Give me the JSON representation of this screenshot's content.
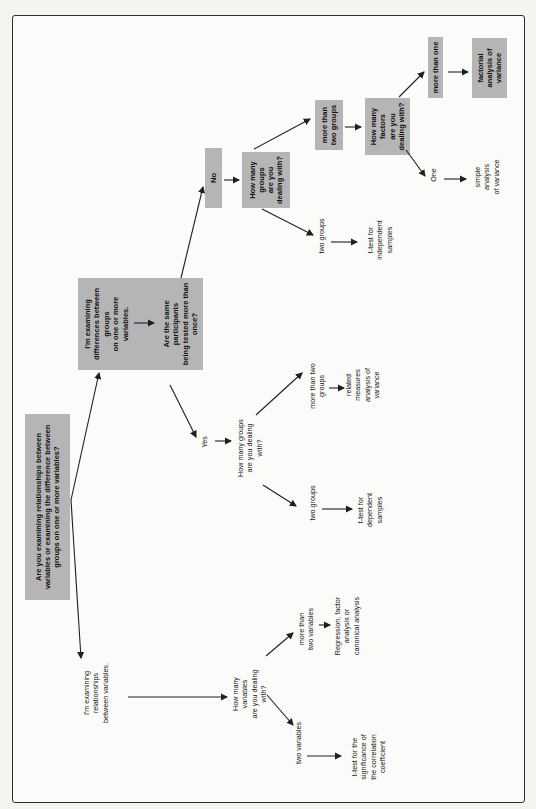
{
  "figure": {
    "kind": "statistics decision-tree flowchart",
    "orientation": "rotated 90 degrees (text reads bottom-to-top)",
    "colors": {
      "shaded_box_fill": "#b5b5b5",
      "line": "#1f1f1f",
      "text": "#141414",
      "frame_border": "#2d2d2d",
      "page_bg": "#f5f4f1"
    }
  },
  "nodes": {
    "root": {
      "label": "Are you examining relationships between\nvariables or examining the difference between\ngroups on one or more variables?",
      "shaded": true
    },
    "rel": {
      "label": "I'm examining\nrelationships\nbetween variables.",
      "shaded": false
    },
    "how_many_vars": {
      "label": "How many\nvariables\nare you dealing\nwith?",
      "shaded": false
    },
    "more_two_vars": {
      "label": "more than\ntwo variables",
      "shaded": false
    },
    "regression": {
      "label": "Regression, factor\nanalysis or\ncanonical analysis",
      "shaded": false
    },
    "two_vars": {
      "label": "two variables",
      "shaded": false
    },
    "ttest_corr": {
      "label": "t-test for the\nsignificance of\nthe correlation\ncoefficient",
      "shaded": false
    },
    "diff": {
      "label": "I'm examining\ndifferences between\ngroups\non one or more\nvariables.",
      "shaded": true
    },
    "same_participants": {
      "label": "Are the same\nparticipants\nbeing tested more than\nonce?",
      "shaded": true
    },
    "yes": {
      "label": "Yes",
      "shaded": false
    },
    "no": {
      "label": "No",
      "shaded": true
    },
    "how_many_groups_yes": {
      "label": "How many groups\nare you dealing\nwith?",
      "shaded": false
    },
    "more_two_groups_yes": {
      "label": "more than two\ngroups",
      "shaded": false
    },
    "related_measures": {
      "label": "related\nmeasures\nanalysis of\nvariance",
      "shaded": false
    },
    "two_groups_yes": {
      "label": "two groups",
      "shaded": false
    },
    "ttest_dep": {
      "label": "t-test for\ndependent\nsamples",
      "shaded": false
    },
    "how_many_groups_no": {
      "label": "How many\ngroups\nare you\ndealing with?",
      "shaded": true
    },
    "more_two_groups_no": {
      "label": "more than\ntwo groups",
      "shaded": true
    },
    "how_many_factors": {
      "label": "How many\nfactors\nare you\ndealing with?",
      "shaded": true
    },
    "more_than_one": {
      "label": "more than one",
      "shaded": true
    },
    "factorial": {
      "label": "factorial\nanalysis of\nvariance",
      "shaded": true
    },
    "one": {
      "label": "One",
      "shaded": false
    },
    "simple_anova": {
      "label": "simple\nanalysis\nof variance",
      "shaded": false
    },
    "two_groups_no": {
      "label": "two groups",
      "shaded": false
    },
    "ttest_indep": {
      "label": "t-test for\nindependent\nsamples",
      "shaded": false
    }
  },
  "edges": [
    [
      "root",
      "rel"
    ],
    [
      "root",
      "diff"
    ],
    [
      "rel",
      "how_many_vars"
    ],
    [
      "how_many_vars",
      "more_two_vars"
    ],
    [
      "more_two_vars",
      "regression"
    ],
    [
      "how_many_vars",
      "two_vars"
    ],
    [
      "two_vars",
      "ttest_corr"
    ],
    [
      "diff",
      "same_participants"
    ],
    [
      "same_participants",
      "yes"
    ],
    [
      "same_participants",
      "no"
    ],
    [
      "yes",
      "how_many_groups_yes"
    ],
    [
      "how_many_groups_yes",
      "more_two_groups_yes"
    ],
    [
      "more_two_groups_yes",
      "related_measures"
    ],
    [
      "how_many_groups_yes",
      "two_groups_yes"
    ],
    [
      "two_groups_yes",
      "ttest_dep"
    ],
    [
      "no",
      "how_many_groups_no"
    ],
    [
      "how_many_groups_no",
      "more_two_groups_no"
    ],
    [
      "more_two_groups_no",
      "how_many_factors"
    ],
    [
      "how_many_groups_no",
      "two_groups_no"
    ],
    [
      "two_groups_no",
      "ttest_indep"
    ],
    [
      "how_many_factors",
      "more_than_one"
    ],
    [
      "more_than_one",
      "factorial"
    ],
    [
      "how_many_factors",
      "one"
    ],
    [
      "one",
      "simple_anova"
    ]
  ]
}
